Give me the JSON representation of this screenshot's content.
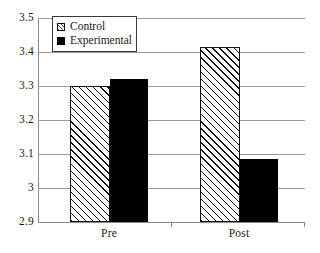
{
  "chart_data": {
    "type": "bar",
    "title": "",
    "xlabel": "",
    "ylabel": "",
    "categories": [
      "Pre",
      "Post"
    ],
    "series": [
      {
        "name": "Control",
        "values": [
          3.3,
          3.415
        ],
        "pattern": "diagonal-hatch"
      },
      {
        "name": "Experimental",
        "values": [
          3.32,
          3.085
        ],
        "pattern": "solid-black"
      }
    ],
    "ylim": [
      2.9,
      3.5
    ],
    "ytick_values": [
      2.9,
      3.0,
      3.1,
      3.2,
      3.3,
      3.4,
      3.5
    ],
    "ytick_labels": [
      "2.9",
      "3",
      "3.1",
      "3.2",
      "3.3",
      "3.4",
      "3.5"
    ],
    "grid": true,
    "legend_position": "upper-left-inside"
  },
  "legend": {
    "items": [
      {
        "label": "Control",
        "swatch": "hatch-swatch-icon"
      },
      {
        "label": "Experimental",
        "swatch": "solid-swatch-icon"
      }
    ]
  },
  "colors": {
    "control_fill": "#ffffff",
    "control_hatch": "#111111",
    "experimental_fill": "#000000",
    "gridline": "#9a9a9a",
    "axis": "#8a8a8a",
    "text": "#1a1a1a",
    "background": "#ffffff"
  }
}
